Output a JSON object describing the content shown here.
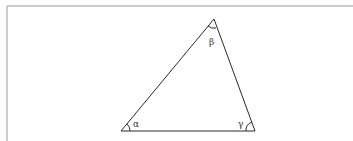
{
  "diagram": {
    "type": "triangle",
    "frame": {
      "left_x": 7,
      "top_y": 6,
      "color": "#9a9a9a"
    },
    "stroke_color": "#2a2a2a",
    "vertices": {
      "top": {
        "x": 214,
        "y": 19
      },
      "bottom_left": {
        "x": 121,
        "y": 131
      },
      "bottom_right": {
        "x": 255,
        "y": 131
      }
    },
    "angles": [
      {
        "name": "alpha",
        "label": "α",
        "vertex": "bottom_left",
        "label_x": 133,
        "label_y": 127
      },
      {
        "name": "beta",
        "label": "β",
        "vertex": "top",
        "label_x": 209,
        "label_y": 45
      },
      {
        "name": "gamma",
        "label": "γ",
        "vertex": "bottom_right",
        "label_x": 238,
        "label_y": 127
      }
    ]
  }
}
